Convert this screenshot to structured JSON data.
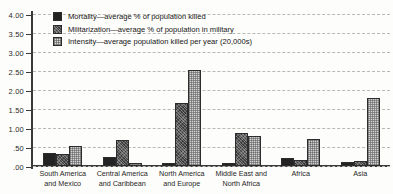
{
  "chart_data": {
    "type": "bar",
    "title": "",
    "xlabel": "",
    "ylabel": "",
    "ylim": [
      0,
      4.0
    ],
    "grid": true,
    "legend_position": "top-left-inside",
    "ytick_labels": [
      "4.00",
      "3.50",
      "3.00",
      "2.50",
      "2.00",
      "1.50",
      "1.00",
      ".50",
      ".00"
    ],
    "ytick_values": [
      4.0,
      3.5,
      3.0,
      2.5,
      2.0,
      1.5,
      1.0,
      0.5,
      0.0
    ],
    "categories": [
      "South America and Mexico",
      "Central America and Caribbean",
      "North America and Europe",
      "Middle East and North Africa",
      "Africa",
      "Asia"
    ],
    "category_lines": [
      [
        "South America",
        "and Mexico"
      ],
      [
        "Central America",
        "and Caribbean"
      ],
      [
        "North America",
        "and Europe"
      ],
      [
        "Middle East and",
        "North Africa"
      ],
      [
        "Africa"
      ],
      [
        "Asia"
      ]
    ],
    "series": [
      {
        "name": "Mortality—average % of population killed",
        "key": "mortality",
        "color": "#232323",
        "values": [
          0.33,
          0.25,
          0.07,
          0.09,
          0.22,
          0.1
        ]
      },
      {
        "name": "Militarization—average % of population in military",
        "key": "militarization",
        "color": "#3b3b3b",
        "values": [
          0.32,
          0.68,
          1.65,
          0.86,
          0.15,
          0.12
        ]
      },
      {
        "name": "Intensity—average population killed per year (20,000s)",
        "key": "intensity",
        "color": "#d2d2d2",
        "values": [
          0.52,
          0.09,
          2.52,
          0.8,
          0.7,
          1.79
        ]
      }
    ]
  }
}
